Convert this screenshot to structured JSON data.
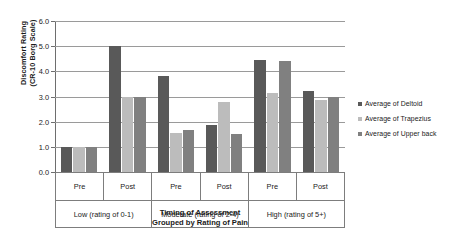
{
  "chart_data": {
    "type": "bar",
    "title": "",
    "subtitle": "",
    "xlabel": "Timing of Assessment",
    "xlabel_line2": "Grouped by Rating of Pain",
    "ylabel": "Discomfort Rating",
    "ylabel_line2": "(CR-10 Borg Scale)",
    "ylim": [
      0.0,
      6.0
    ],
    "ytick_step": 1.0,
    "ytick_labels": [
      "0.0",
      "1.0",
      "2.0",
      "3.0",
      "4.0",
      "5.0",
      "6.0"
    ],
    "ytick_values": [
      0.0,
      1.0,
      2.0,
      3.0,
      4.0,
      5.0,
      6.0
    ],
    "grid": "horizontal",
    "legend_position": "right",
    "categories": [
      "Pre",
      "Post",
      "Pre",
      "Post",
      "Pre",
      "Post"
    ],
    "group_labels": [
      "Low (rating of 0-1)",
      "Moderate (rating of 2-4)",
      "High (rating of 5+)"
    ],
    "series": [
      {
        "name": "Average of Deltoid",
        "color": "#595959",
        "values": [
          1.0,
          5.0,
          3.8,
          1.85,
          4.45,
          3.2
        ]
      },
      {
        "name": "Average of Trapezius",
        "color": "#bcbcbc",
        "values": [
          1.0,
          3.0,
          1.55,
          2.8,
          3.15,
          2.85
        ]
      },
      {
        "name": "Average of Upper back",
        "color": "#808080",
        "values": [
          1.0,
          3.0,
          1.65,
          1.5,
          4.4,
          3.0
        ]
      }
    ]
  }
}
